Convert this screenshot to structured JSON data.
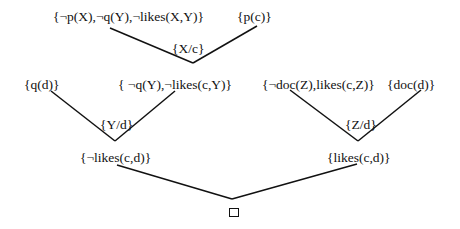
{
  "diagram": {
    "type": "resolution-refutation-tree",
    "clauses": {
      "c1": "{¬p(X),¬q(Y),¬likes(X,Y)}",
      "c2": "{p(c)}",
      "c3": "{q(d)}",
      "c4": "{ ¬q(Y),¬likes(c,Y)}",
      "c5": "{¬doc(Z),likes(c,Z)}",
      "c6": "{doc(d)}",
      "c7": "{¬likes(c,d)}",
      "c8": "{likes(c,d)}",
      "empty": "□"
    },
    "substitutions": {
      "s1": "{X/c}",
      "s2": "{Y/d}",
      "s3": "{Z/d}"
    },
    "edges": [
      {
        "from": "c1",
        "to": "c4",
        "via": "s1"
      },
      {
        "from": "c2",
        "to": "c4",
        "via": "s1"
      },
      {
        "from": "c3",
        "to": "c7",
        "via": "s2"
      },
      {
        "from": "c4",
        "to": "c7",
        "via": "s2"
      },
      {
        "from": "c5",
        "to": "c8",
        "via": "s3"
      },
      {
        "from": "c6",
        "to": "c8",
        "via": "s3"
      },
      {
        "from": "c7",
        "to": "empty"
      },
      {
        "from": "c8",
        "to": "empty"
      }
    ]
  }
}
